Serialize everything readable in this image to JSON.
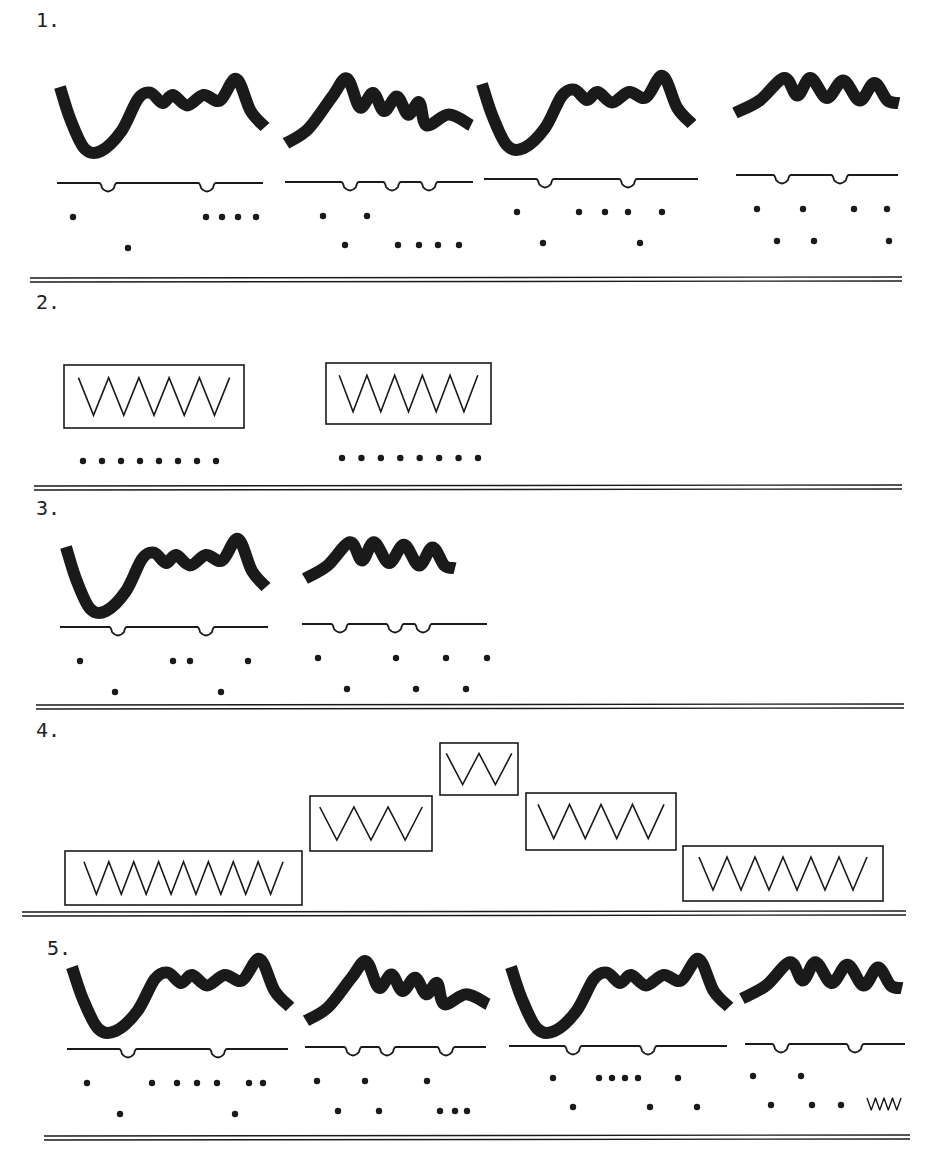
{
  "colors": {
    "ink": "#1a1a1a",
    "paper": "#ffffff"
  },
  "sections": [
    {
      "label": "1.",
      "type": "waveform-group",
      "label_pos": [
        36,
        8
      ],
      "divider": {
        "x": 30,
        "y": 278,
        "w": 872
      },
      "panels": [
        {
          "kind": "A",
          "x": 60,
          "y": 75,
          "w": 205,
          "h": 80,
          "baseline": {
            "x1": 57,
            "x2": 263,
            "y": 183,
            "notches": [
              108,
              207
            ]
          },
          "dots_top": [
            73,
            206,
            222,
            238,
            256
          ],
          "dots_top_y": 217,
          "dots_bottom": [
            128
          ],
          "dots_bottom_y": 248
        },
        {
          "kind": "B",
          "x": 286,
          "y": 75,
          "w": 185,
          "h": 72,
          "baseline": {
            "x1": 285,
            "x2": 473,
            "y": 182,
            "notches": [
              350,
              392,
              429
            ]
          },
          "dots_top": [
            323,
            367
          ],
          "dots_top_y": 216,
          "dots_bottom": [
            345,
            398,
            419,
            438,
            459
          ],
          "dots_bottom_y": 245
        },
        {
          "kind": "A",
          "x": 482,
          "y": 72,
          "w": 210,
          "h": 80,
          "baseline": {
            "x1": 484,
            "x2": 698,
            "y": 179,
            "notches": [
              545,
              628
            ]
          },
          "dots_top": [
            517,
            579,
            605,
            628,
            662
          ],
          "dots_top_y": 212,
          "dots_bottom": [
            543,
            640
          ],
          "dots_bottom_y": 243
        },
        {
          "kind": "C",
          "x": 735,
          "y": 73,
          "w": 164,
          "h": 50,
          "baseline": {
            "x1": 736,
            "x2": 898,
            "y": 175,
            "notches": [
              782,
              840
            ]
          },
          "dots_top": [
            757,
            803,
            854,
            887
          ],
          "dots_top_y": 209,
          "dots_bottom": [
            777,
            814,
            889
          ],
          "dots_bottom_y": 241
        }
      ]
    },
    {
      "label": "2.",
      "type": "box-group",
      "label_pos": [
        36,
        290
      ],
      "divider": {
        "x": 34,
        "y": 486,
        "w": 868
      },
      "boxes": [
        {
          "x": 64,
          "y": 365,
          "w": 180,
          "h": 63,
          "zigzags": 5,
          "dots": 8,
          "dots_y": 461,
          "dots_x1": 83,
          "dots_x2": 216
        },
        {
          "x": 326,
          "y": 363,
          "w": 165,
          "h": 61,
          "zigzags": 5,
          "dots": 8,
          "dots_y": 458,
          "dots_x1": 342,
          "dots_x2": 478
        }
      ]
    },
    {
      "label": "3.",
      "type": "waveform-group",
      "label_pos": [
        36,
        496
      ],
      "divider": {
        "x": 36,
        "y": 705,
        "w": 868
      },
      "panels": [
        {
          "kind": "A",
          "x": 66,
          "y": 535,
          "w": 200,
          "h": 80,
          "baseline": {
            "x1": 60,
            "x2": 268,
            "y": 627,
            "notches": [
              118,
              206
            ]
          },
          "dots_top": [
            80,
            173,
            190,
            248
          ],
          "dots_top_y": 661,
          "dots_bottom": [
            115,
            221
          ],
          "dots_bottom_y": 692
        },
        {
          "kind": "C",
          "x": 305,
          "y": 537,
          "w": 150,
          "h": 52,
          "baseline": {
            "x1": 302,
            "x2": 487,
            "y": 624,
            "notches": [
              340,
              395,
              423
            ]
          },
          "dots_top": [
            318,
            396,
            446,
            487
          ],
          "dots_top_y": 658,
          "dots_bottom": [
            347,
            416,
            466
          ],
          "dots_bottom_y": 689
        }
      ]
    },
    {
      "label": "4.",
      "type": "staircase",
      "label_pos": [
        36,
        718
      ],
      "divider": {
        "x": 22,
        "y": 912,
        "w": 884
      },
      "boxes": [
        {
          "x": 36,
          "y": 851,
          "w": 131,
          "h": 54,
          "zigzags": 8
        },
        {
          "x": 171,
          "y": 796,
          "w": 68,
          "h": 54,
          "zigzags": 3
        },
        {
          "x": 243,
          "y": 743,
          "w": 44,
          "h": 52,
          "zigzags": 2
        },
        {
          "x": 291,
          "y": 793,
          "w": 84,
          "h": 56,
          "zigzags": 4
        },
        {
          "x": 378,
          "y": 846,
          "w": 110,
          "h": 55,
          "zigzags": 6
        }
      ]
    },
    {
      "label": "5.",
      "type": "waveform-group",
      "label_pos": [
        47,
        936
      ],
      "divider": {
        "x": 44,
        "y": 1136,
        "w": 866
      },
      "panels": [
        {
          "kind": "A",
          "x": 72,
          "y": 955,
          "w": 218,
          "h": 80,
          "baseline": {
            "x1": 67,
            "x2": 288,
            "y": 1049,
            "notches": [
              128,
              218
            ]
          },
          "dots_top": [
            87,
            152,
            177,
            197,
            217,
            249,
            263
          ],
          "dots_top_y": 1083,
          "dots_bottom": [
            120,
            235
          ],
          "dots_bottom_y": 1114
        },
        {
          "kind": "B",
          "x": 306,
          "y": 958,
          "w": 182,
          "h": 66,
          "baseline": {
            "x1": 305,
            "x2": 486,
            "y": 1047,
            "notches": [
              353,
              387,
              446
            ]
          },
          "dots_top": [
            317,
            365,
            427
          ],
          "dots_top_y": 1081,
          "dots_bottom": [
            338,
            379,
            440,
            455,
            467
          ],
          "dots_bottom_y": 1111
        },
        {
          "kind": "A",
          "x": 511,
          "y": 955,
          "w": 218,
          "h": 80,
          "baseline": {
            "x1": 509,
            "x2": 727,
            "y": 1046,
            "notches": [
              573,
              648
            ]
          },
          "dots_top": [
            553,
            599,
            612,
            625,
            638,
            678
          ],
          "dots_top_y": 1078,
          "dots_bottom": [
            573,
            650,
            697
          ],
          "dots_bottom_y": 1107
        },
        {
          "kind": "C",
          "x": 742,
          "y": 957,
          "w": 160,
          "h": 52,
          "baseline": {
            "x1": 745,
            "x2": 905,
            "y": 1044,
            "notches": [
              781,
              855
            ]
          },
          "dots_top": [
            753,
            801
          ],
          "dots_top_y": 1076,
          "dots_bottom": [
            771,
            812,
            841
          ],
          "dots_bottom_y": 1105,
          "squiggle": {
            "x": 867,
            "y": 1098,
            "w": 34,
            "h": 12
          }
        }
      ]
    }
  ],
  "staircase_layout": {
    "scale_x": 2,
    "boxes_px": [
      {
        "x": 65,
        "y": 851,
        "w": 237,
        "h": 54
      },
      {
        "x": 310,
        "y": 796,
        "w": 122,
        "h": 55
      },
      {
        "x": 440,
        "y": 743,
        "w": 78,
        "h": 52
      },
      {
        "x": 526,
        "y": 793,
        "w": 150,
        "h": 57
      },
      {
        "x": 683,
        "y": 846,
        "w": 200,
        "h": 55
      }
    ]
  }
}
